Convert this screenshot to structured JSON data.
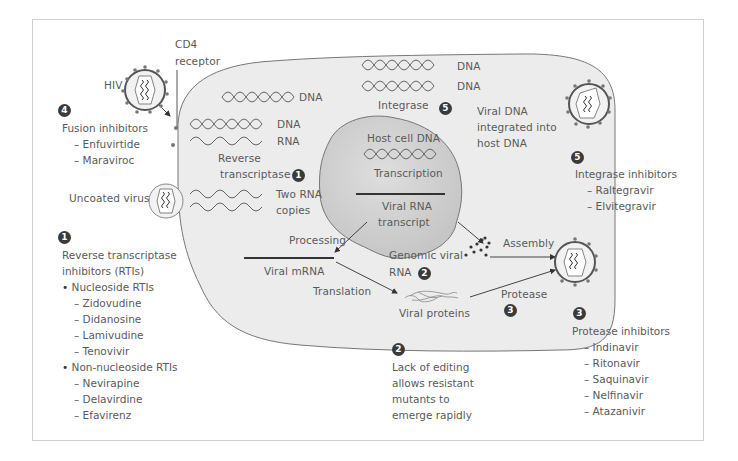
{
  "labels": {
    "hiv": "HIV",
    "cd4_line1": "CD4",
    "cd4_line2": "receptor",
    "dna_top": "DNA",
    "rt_dna": "DNA",
    "rt_rna": "RNA",
    "rt_line1": "Reverse",
    "rt_line2": "transcriptase",
    "two_rna_1": "Two RNA",
    "two_rna_2": "copies",
    "uncoated": "Uncoated virus",
    "int_dna1": "DNA",
    "int_dna2": "DNA",
    "integrase": "Integrase",
    "viral_dna_1": "Viral DNA",
    "viral_dna_2": "integrated into",
    "viral_dna_3": "host DNA",
    "host_dna": "Host cell DNA",
    "transcription": "Transcription",
    "viral_rna_1": "Viral RNA",
    "viral_rna_2": "transcript",
    "processing": "Processing",
    "viral_mrna": "Viral mRNA",
    "translation": "Translation",
    "genomic_1": "Genomic viral",
    "genomic_2": "RNA",
    "assembly": "Assembly",
    "protease": "Protease",
    "viral_proteins": "Viral proteins"
  },
  "badges": {
    "fusion": "4",
    "rt": "1",
    "rt_inline": "1",
    "integrase": "5",
    "integrase_inline": "5",
    "genomic": "2",
    "protease_inline": "3",
    "protease": "3",
    "editing": "2"
  },
  "drug_classes": {
    "fusion": {
      "title": "Fusion inhibitors",
      "items": [
        "– Enfuvirtide",
        "– Maraviroc"
      ]
    },
    "rti": {
      "title_1": "Reverse transcriptase",
      "title_2": "inhibitors (RTIs)",
      "nucleoside": "Nucleoside RTIs",
      "nucleoside_items": [
        "– Zidovudine",
        "– Didanosine",
        "– Lamivudine",
        "– Tenovivir"
      ],
      "non_nucleoside": "Non-nucleoside RTIs",
      "non_nucleoside_items": [
        "– Nevirapine",
        "– Delavirdine",
        "– Efavirenz"
      ]
    },
    "integrase": {
      "title": "Integrase inhibitors",
      "items": [
        "– Raltegravir",
        "– Elvitegravir"
      ]
    },
    "protease": {
      "title": "Protease inhibitors",
      "items": [
        "– Indinavir",
        "– Ritonavir",
        "– Saquinavir",
        "– Nelfinavir",
        "– Atazanivir"
      ]
    },
    "editing": {
      "lines": [
        "Lack of editing",
        "allows resistant",
        "mutants to",
        "emerge rapidly"
      ]
    }
  },
  "colors": {
    "cell_fill": "#ececec",
    "nucleus_fill": "#d2d2d2",
    "outline": "#777777",
    "badge": "#3a3a3a",
    "text": "#5a5a5a"
  }
}
